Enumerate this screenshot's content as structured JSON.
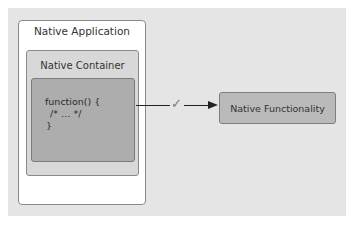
{
  "diagram": {
    "native_application": {
      "label": "Native Application"
    },
    "native_container": {
      "label": "Native Container"
    },
    "code_block": {
      "lines": [
        "function() {",
        "/* … */",
        "}"
      ]
    },
    "connector": {
      "check_symbol": "✓",
      "icon": "checkmark-icon"
    },
    "native_functionality": {
      "label": "Native Functionality"
    }
  },
  "colors": {
    "panel_background": "#e5e5e5",
    "app_box": "#ffffff",
    "container_box": "#d8d8d8",
    "code_box": "#adadad",
    "functionality_box": "#bababa",
    "arrow": "#222222"
  }
}
